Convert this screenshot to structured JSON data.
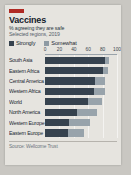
{
  "card": {
    "brand_color": "#b02a24",
    "title": "Vaccines",
    "subtitle": "% agreeing they are safe",
    "subtitle2": "Selected regions, 2019"
  },
  "legend": {
    "items": [
      {
        "label": "Strongly",
        "color": "#36424e"
      },
      {
        "label": "Somewhat",
        "color": "#98a3ab"
      }
    ]
  },
  "footer": {
    "source": "Source: Wellcome Trust"
  },
  "chart_data": {
    "type": "bar",
    "orientation": "horizontal",
    "stacked": true,
    "title": "Vaccines",
    "subtitle": "% agreeing they are safe",
    "xlabel": "",
    "ylabel": "",
    "xlim": [
      0,
      100
    ],
    "ticks": [
      0,
      20,
      40,
      60,
      80,
      100
    ],
    "grid": true,
    "legend_position": "top-left",
    "categories": [
      "South Asia",
      "Eastern Africa",
      "Central America",
      "Western Africa",
      "World",
      "North America",
      "Western Europe",
      "Eastern Europe"
    ],
    "series": [
      {
        "name": "Strongly",
        "color": "#36424e",
        "values": [
          84,
          81,
          70,
          68,
          60,
          44,
          34,
          32
        ]
      },
      {
        "name": "Somewhat",
        "color": "#98a3ab",
        "values": [
          5,
          7,
          14,
          15,
          19,
          28,
          28,
          22
        ]
      }
    ],
    "totals": [
      89,
      88,
      84,
      83,
      79,
      72,
      62,
      54
    ]
  }
}
